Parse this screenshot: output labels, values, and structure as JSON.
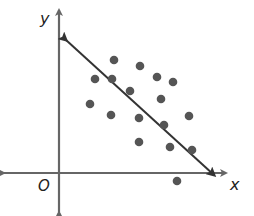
{
  "chart_data": {
    "type": "scatter",
    "title": "",
    "xlabel": "x",
    "ylabel": "y",
    "origin_label": "O",
    "grid": false,
    "legend": null,
    "trend_line": {
      "description": "line of best fit with negative slope, arrows on both ends",
      "start_px": [
        66,
        40
      ],
      "end_px": [
        214,
        175
      ]
    },
    "points_px": [
      [
        114,
        60
      ],
      [
        140,
        66
      ],
      [
        157,
        77
      ],
      [
        173,
        82
      ],
      [
        95,
        79
      ],
      [
        112,
        79
      ],
      [
        130,
        91
      ],
      [
        161,
        99
      ],
      [
        90,
        104
      ],
      [
        111,
        115
      ],
      [
        139,
        118
      ],
      [
        189,
        116
      ],
      [
        164,
        125
      ],
      [
        139,
        142
      ],
      [
        170,
        147
      ],
      [
        192,
        150
      ],
      [
        177,
        181
      ]
    ],
    "axes": {
      "origin_px": [
        59,
        173
      ],
      "x_axis": {
        "from_px": 4,
        "to_px": 226
      },
      "y_axis": {
        "from_px": 10,
        "to_px": 212
      }
    }
  },
  "colors": {
    "axis": "#666666",
    "line": "#333333",
    "point": "#555555",
    "label": "#222222"
  }
}
